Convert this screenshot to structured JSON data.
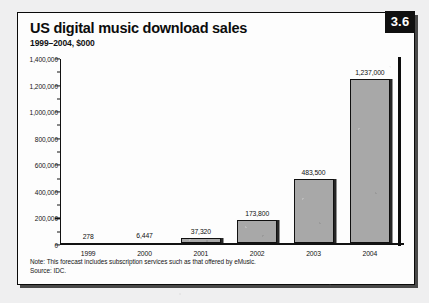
{
  "badge": {
    "number": "3.6"
  },
  "header": {
    "title": "US digital music download sales",
    "subtitle": "1999–2004, $000"
  },
  "footnotes": {
    "note": "Note: This forecast includes subscription services such as that offered by eMusic.",
    "source": "Source: IDC."
  },
  "colors": {
    "bar_fill": "#a8a8a8",
    "bar_outline": "#101010",
    "badge_bg": "#101010",
    "badge_text": "#ffffff",
    "frame_border": "#0a0a0a",
    "page_bg": "#efeff0"
  },
  "chart_data": {
    "type": "bar",
    "title": "US digital music download sales",
    "subtitle": "1999–2004, $000",
    "xlabel": "",
    "ylabel": "",
    "categories": [
      "1999",
      "2000",
      "2001",
      "2002",
      "2003",
      "2004"
    ],
    "values": [
      278,
      6447,
      37320,
      173800,
      483500,
      1237000
    ],
    "value_labels": [
      "278",
      "6,447",
      "37,320",
      "173,800",
      "483,500",
      "1,237,000"
    ],
    "ylim": [
      0,
      1400000
    ],
    "ytick_values": [
      0,
      200000,
      400000,
      600000,
      800000,
      1000000,
      1200000,
      1400000
    ],
    "ytick_labels": [
      "0",
      "200,000",
      "400,000",
      "600,000",
      "800,000",
      "1,000,000",
      "1,200,000",
      "1,400,000"
    ],
    "grid": false,
    "legend": false,
    "series": [
      {
        "name": "Digital music download sales",
        "values": [
          278,
          6447,
          37320,
          173800,
          483500,
          1237000
        ]
      }
    ]
  }
}
